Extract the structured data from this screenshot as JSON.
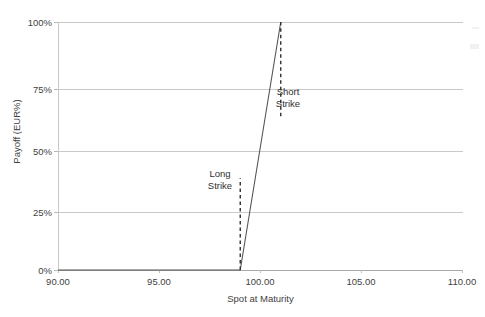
{
  "chart_data": {
    "type": "line",
    "title": "",
    "xlabel": "Spot at Maturity",
    "ylabel": "Payoff (EUR%)",
    "xlim": [
      90.0,
      110.0
    ],
    "ylim": [
      0,
      100
    ],
    "xticks": [
      "90.00",
      "95.00",
      "100.00",
      "105.00",
      "110.00"
    ],
    "xtick_values": [
      90.0,
      95.0,
      100.0,
      105.0,
      110.0
    ],
    "yticks": [
      "0%",
      "25%",
      "50%",
      "75%",
      "100%"
    ],
    "ytick_values": [
      0,
      25,
      50,
      75,
      100
    ],
    "grid": true,
    "legend": "none",
    "series": [
      {
        "name": "Payoff",
        "style": "solid",
        "color": "#555555",
        "x": [
          90.0,
          99.0,
          101.0,
          101.0
        ],
        "values": [
          0,
          0,
          100,
          100
        ]
      }
    ],
    "reference_lines": [
      {
        "name": "Long Strike",
        "style": "dashed",
        "color": "#2f2f2f",
        "x": 99.0,
        "y_from": 0,
        "y_to": 37
      },
      {
        "name": "Short Strike",
        "style": "dashed",
        "color": "#2f2f2f",
        "x": 101.0,
        "y_from": 62,
        "y_to": 100
      }
    ],
    "annotations": [
      {
        "name": "long-strike",
        "line1": "Long",
        "line2": "Strike",
        "x": 98.6,
        "y": 41
      },
      {
        "name": "short-strike",
        "line1": "Short",
        "line2": "Strike",
        "x": 101.3,
        "y": 74
      }
    ]
  },
  "axes": {
    "x_title": "Spot at Maturity",
    "y_title": "Payoff (EUR%)",
    "x_labels": [
      "90.00",
      "95.00",
      "100.00",
      "105.00",
      "110.00"
    ],
    "y_labels": [
      "100%",
      "75%",
      "50%",
      "25%",
      "0%"
    ]
  },
  "annotations": {
    "long": {
      "line1": "Long",
      "line2": "Strike"
    },
    "short": {
      "line1": "Short",
      "line2": "Strike"
    }
  },
  "colors": {
    "series": "#555555",
    "gridline": "#c9c9c9",
    "axis": "#a8a8a8",
    "text": "#3f3f3f",
    "background": "#ffffff"
  }
}
